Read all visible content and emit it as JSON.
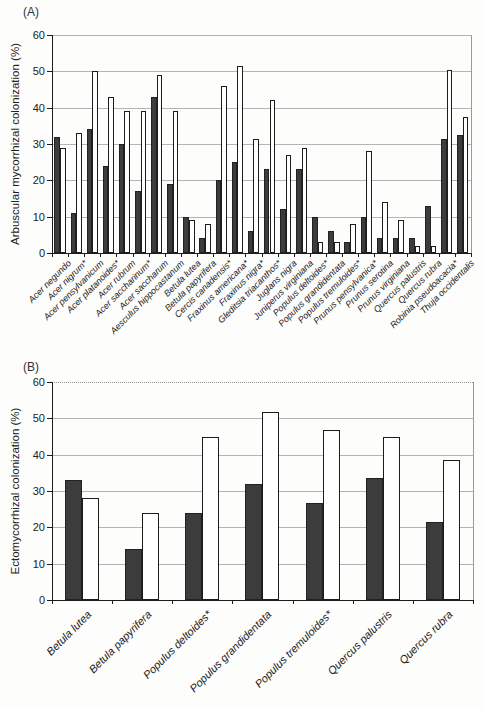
{
  "chart_data": [
    {
      "type": "bar",
      "title": "(A)",
      "ylabel": "Arbuscular mycorrhizal colonization (%)",
      "ylim": [
        0,
        60
      ],
      "yticks": [
        0,
        10,
        20,
        30,
        40,
        50,
        60
      ],
      "grid": "horizontal",
      "legend": "none",
      "categories": [
        "Acer negundo",
        "Acer nigrum*",
        "Acer pensylvanicum",
        "Acer platanoides*",
        "Acer rubrum",
        "Acer saccharinum*",
        "Acer saccharum",
        "Aesculus hippocastanum",
        "Betula lutea",
        "Betula papyrifera",
        "Cercis canadensis*",
        "Fraxinus americana*",
        "Fraxinus nigra*",
        "Gleditsia triacanthos*",
        "Juglans nigra",
        "Juniperus virginiana",
        "Populus deltoides*",
        "Populus grandidentata",
        "Populus tremuloides*",
        "Prunus pensylvanica*",
        "Prunus serotina",
        "Prunus virginiana",
        "Quercus palustris",
        "Quercus rubra",
        "Robinia pseudoacacia*",
        "Thuja occidentalis"
      ],
      "series": [
        {
          "name": "filled",
          "values": [
            32,
            11,
            34,
            24,
            30,
            17,
            43,
            19,
            10,
            4,
            20,
            25,
            6,
            23,
            12,
            23,
            10,
            6,
            3,
            10,
            4,
            4,
            4,
            13,
            31.5,
            32.5
          ]
        },
        {
          "name": "open",
          "values": [
            29,
            33,
            50,
            43,
            39,
            39,
            49,
            39,
            9,
            8,
            46,
            51.5,
            31.5,
            42,
            27,
            29,
            3,
            3,
            8,
            28,
            14,
            9,
            2,
            2,
            50.5,
            37.5
          ]
        }
      ]
    },
    {
      "type": "bar",
      "title": "(B)",
      "ylabel": "Ectomycorrhizal  colonization (%)",
      "ylim": [
        0,
        60
      ],
      "yticks": [
        0,
        10,
        20,
        30,
        40,
        50,
        60
      ],
      "grid": "horizontal",
      "legend": "none",
      "categories": [
        "Betula lutea",
        "Betula papyrifera",
        "Populus deltoides*",
        "Populus grandidentata",
        "Populus tremuloides*",
        "Quercus palustris",
        "Quercus rubra"
      ],
      "series": [
        {
          "name": "filled",
          "values": [
            33,
            14,
            24,
            31.8,
            26.8,
            33.6,
            21.5
          ]
        },
        {
          "name": "open",
          "values": [
            28,
            24,
            45,
            51.8,
            46.8,
            44.8,
            38.6
          ]
        }
      ]
    }
  ],
  "bar_colors": {
    "filled": "#3c3c3c",
    "open": "#ffffff"
  }
}
